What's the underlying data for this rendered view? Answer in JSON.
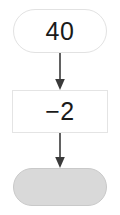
{
  "diagram": {
    "type": "flowchart",
    "orientation": "vertical",
    "title": "",
    "background_color": "#ffffff",
    "nodes": [
      {
        "id": "start",
        "shape": "stadium",
        "label": "40",
        "fill_color": "#ffffff",
        "border_color": "#e2e2e2",
        "text_color": "#1a1a1a"
      },
      {
        "id": "operation",
        "shape": "rectangle",
        "label": "−2",
        "fill_color": "#ffffff",
        "border_color": "#e4e4e4",
        "text_color": "#1a1a1a"
      },
      {
        "id": "result",
        "shape": "stadium",
        "label": "",
        "fill_color": "#d9d9d9",
        "border_color": "#c9c9c9",
        "text_color": "#1a1a1a"
      }
    ],
    "edges": [
      {
        "id": "edge-start-operation",
        "from": "start",
        "to": "operation",
        "label": "",
        "arrowhead": "filled-triangle",
        "color": "#3a3a3a"
      },
      {
        "id": "edge-operation-result",
        "from": "operation",
        "to": "result",
        "label": "",
        "arrowhead": "filled-triangle",
        "color": "#3a3a3a"
      }
    ]
  }
}
